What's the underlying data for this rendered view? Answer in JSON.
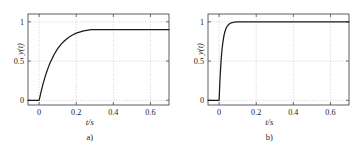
{
  "figure": {
    "background_color": "#ffffff",
    "curve_color": "#1a1a1a",
    "grid_color": "#b8b8b8",
    "axis_color": "#4d4d4d",
    "text_color": "#1a1a1a"
  },
  "chart_data": [
    {
      "type": "line",
      "title": "",
      "panel_label": "a)",
      "xlabel": "t/s",
      "ylabel": "y(t)",
      "xlim": [
        -0.06,
        0.7
      ],
      "ylim": [
        -0.06,
        1.1
      ],
      "xticks": [
        0,
        0.2,
        0.4,
        0.6
      ],
      "xticklabels": [
        "0",
        "0.2",
        "0.4",
        "0.6"
      ],
      "yticks": [
        0,
        0.5,
        1
      ],
      "yticklabels": [
        "0",
        "0.5",
        "1"
      ],
      "grid": true,
      "legend": "none",
      "series": [
        {
          "name": "step response a",
          "description": "first-order step response, steady-state gain 0.9, time constant 0.08 s, step at t=0",
          "x": [
            -0.06,
            -0.04,
            -0.02,
            -0.005,
            0.0,
            0.01,
            0.02,
            0.03,
            0.04,
            0.05,
            0.06,
            0.08,
            0.1,
            0.12,
            0.14,
            0.16,
            0.18,
            0.2,
            0.24,
            0.28,
            0.32,
            0.36,
            0.4,
            0.45,
            0.5,
            0.55,
            0.6,
            0.65,
            0.7
          ],
          "y": [
            0.0,
            0.0,
            0.0,
            0.0,
            0.0,
            0.105,
            0.199,
            0.283,
            0.357,
            0.423,
            0.482,
            0.581,
            0.658,
            0.719,
            0.766,
            0.803,
            0.832,
            0.856,
            0.885,
            0.9,
            0.9,
            0.9,
            0.9,
            0.9,
            0.9,
            0.9,
            0.9,
            0.9,
            0.9
          ]
        }
      ]
    },
    {
      "type": "line",
      "title": "",
      "panel_label": "b)",
      "xlabel": "t/s",
      "ylabel": "y(t)",
      "xlim": [
        -0.06,
        0.7
      ],
      "ylim": [
        -0.06,
        1.1
      ],
      "xticks": [
        0,
        0.2,
        0.4,
        0.6
      ],
      "xticklabels": [
        "0",
        "0.2",
        "0.4",
        "0.6"
      ],
      "yticks": [
        0,
        0.5,
        1
      ],
      "yticklabels": [
        "0",
        "0.5",
        "1"
      ],
      "grid": true,
      "legend": "none",
      "series": [
        {
          "name": "step response b",
          "description": "first-order step response, steady-state gain 1.0, time constant 0.015 s, step at t=0",
          "x": [
            -0.06,
            -0.04,
            -0.02,
            -0.005,
            0.0,
            0.004,
            0.008,
            0.012,
            0.016,
            0.02,
            0.025,
            0.03,
            0.035,
            0.04,
            0.05,
            0.06,
            0.07,
            0.08,
            0.1,
            0.15,
            0.2,
            0.3,
            0.4,
            0.5,
            0.6,
            0.7
          ],
          "y": [
            0.0,
            0.0,
            0.0,
            0.0,
            0.0,
            0.233,
            0.413,
            0.551,
            0.657,
            0.736,
            0.811,
            0.865,
            0.902,
            0.931,
            0.964,
            0.982,
            0.99,
            0.995,
            0.999,
            1.0,
            1.0,
            1.0,
            1.0,
            1.0,
            1.0,
            1.0
          ]
        }
      ]
    }
  ]
}
